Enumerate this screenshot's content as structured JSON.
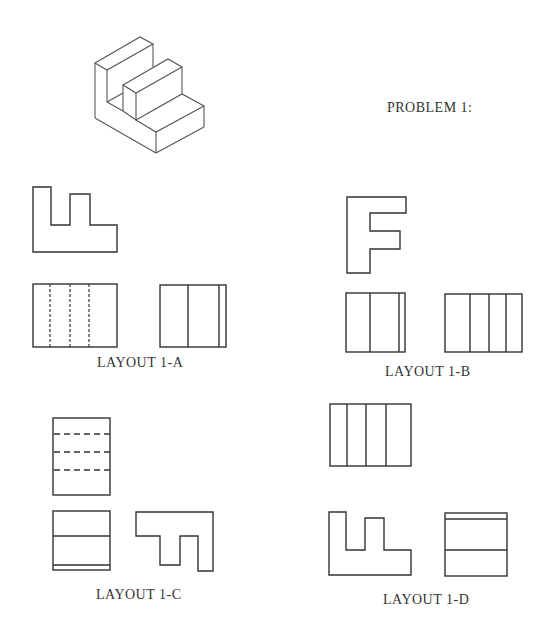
{
  "problem": {
    "title": "PROBLEM 1:"
  },
  "layouts": [
    {
      "id": "1-A",
      "label": "LAYOUT 1-A"
    },
    {
      "id": "1-B",
      "label": "LAYOUT 1-B"
    },
    {
      "id": "1-C",
      "label": "LAYOUT 1-C"
    },
    {
      "id": "1-D",
      "label": "LAYOUT 1-D"
    }
  ],
  "colors": {
    "line": "#333333",
    "background": "#ffffff"
  }
}
